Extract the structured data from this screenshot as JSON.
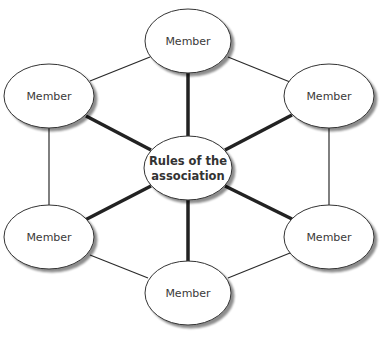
{
  "diagram": {
    "type": "hub-and-ring network",
    "colors": {
      "background": "#ffffff",
      "node_fill": "#ffffff",
      "node_stroke": "#333333",
      "shadow": "#9a9a9a",
      "thin_edge": "#2a2a2a",
      "thick_edge": "#222222",
      "text": "#3a3a3a"
    },
    "center": {
      "id": "rules",
      "line1": "Rules of the",
      "line2": "association"
    },
    "members": [
      {
        "id": "member-top",
        "label": "Member"
      },
      {
        "id": "member-upper-right",
        "label": "Member"
      },
      {
        "id": "member-lower-right",
        "label": "Member"
      },
      {
        "id": "member-bottom",
        "label": "Member"
      },
      {
        "id": "member-lower-left",
        "label": "Member"
      },
      {
        "id": "member-upper-left",
        "label": "Member"
      }
    ],
    "edges": {
      "spokes_thick": [
        [
          "rules",
          "member-top"
        ],
        [
          "rules",
          "member-upper-right"
        ],
        [
          "rules",
          "member-lower-right"
        ],
        [
          "rules",
          "member-bottom"
        ],
        [
          "rules",
          "member-lower-left"
        ],
        [
          "rules",
          "member-upper-left"
        ]
      ],
      "ring_thin": [
        [
          "member-top",
          "member-upper-right"
        ],
        [
          "member-upper-right",
          "member-lower-right"
        ],
        [
          "member-lower-right",
          "member-bottom"
        ],
        [
          "member-bottom",
          "member-lower-left"
        ],
        [
          "member-lower-left",
          "member-upper-left"
        ],
        [
          "member-upper-left",
          "member-top"
        ]
      ]
    }
  }
}
